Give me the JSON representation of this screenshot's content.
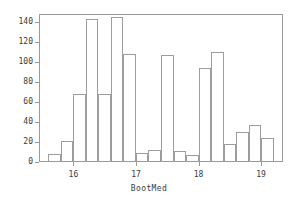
{
  "chart_data": {
    "type": "bar",
    "title": "",
    "subtitle": "",
    "xlabel": "BootMed",
    "ylabel": "",
    "grid": false,
    "legend": "none",
    "xlim": [
      15.45,
      19.35
    ],
    "ylim": [
      0,
      148
    ],
    "bin_width": 0.2,
    "x_ticks": [
      16,
      17,
      18,
      19
    ],
    "x_tick_labels": [
      "16",
      "17",
      "18",
      "19"
    ],
    "y_ticks": [
      0,
      20,
      40,
      60,
      80,
      100,
      120,
      140
    ],
    "y_tick_labels": [
      "0",
      "20",
      "40",
      "60",
      "80",
      "100",
      "120",
      "140"
    ],
    "categories": [
      "15.6",
      "15.8",
      "16.0",
      "16.2",
      "16.4",
      "16.6",
      "16.8",
      "17.0",
      "17.2",
      "17.4",
      "17.6",
      "17.8",
      "18.0",
      "18.2",
      "18.4",
      "18.6",
      "18.8",
      "19.0"
    ],
    "bin_left_edges": [
      15.6,
      15.8,
      16.0,
      16.2,
      16.4,
      16.6,
      16.8,
      17.0,
      17.2,
      17.4,
      17.6,
      17.8,
      18.0,
      18.2,
      18.4,
      18.6,
      18.8,
      19.0
    ],
    "values": [
      8,
      21,
      68,
      143,
      68,
      145,
      108,
      9,
      12,
      107,
      11,
      7,
      94,
      110,
      18,
      30,
      37,
      24
    ],
    "series": [
      {
        "name": "BootMed frequency",
        "values": [
          8,
          21,
          68,
          143,
          68,
          145,
          108,
          9,
          12,
          107,
          11,
          7,
          94,
          110,
          18,
          30,
          37,
          24
        ]
      }
    ]
  },
  "style": {
    "bar_edge_color": "#9d9d9d",
    "bar_fill_color": "#ffffff",
    "frame_color": "#9a9a9a",
    "text_color": "#3b3b3b",
    "background_color": "#ffffff"
  }
}
